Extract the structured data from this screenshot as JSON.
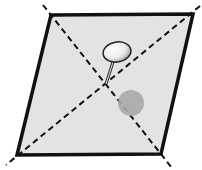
{
  "diagram": {
    "title": "",
    "shape": {
      "type": "parallelogram",
      "vertices": [
        [
          51,
          15
        ],
        [
          193,
          14
        ],
        [
          161,
          154
        ],
        [
          17,
          155
        ]
      ],
      "fill": "#e3e3e3",
      "stroke": "#111111"
    },
    "diagonals": [
      {
        "from": [
          43,
          5
        ],
        "to": [
          172,
          168
        ]
      },
      {
        "from": [
          200,
          6
        ],
        "to": [
          6,
          165
        ]
      }
    ],
    "intersection": [
      105,
      84
    ],
    "pin": {
      "head_center": [
        117,
        52
      ],
      "head_rx": 14,
      "head_ry": 10,
      "needle_from": [
        113,
        62
      ],
      "needle_to": [
        106,
        84
      ]
    },
    "shadow": {
      "center": [
        131,
        103
      ],
      "radius": 13,
      "color": "#a9a9a9"
    }
  }
}
